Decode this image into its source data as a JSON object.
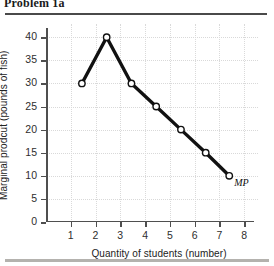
{
  "header": {
    "title": "Problem 1a"
  },
  "chart_data": {
    "type": "line",
    "title": "",
    "xlabel": "Quantity of students (number)",
    "ylabel": "Marginal prodcut (pounds of fish)",
    "xlim": [
      0,
      8.4
    ],
    "ylim": [
      0,
      42
    ],
    "grid": true,
    "legend": "none",
    "series": [
      {
        "name": "MP",
        "label": "MP",
        "x": [
          1.45,
          2.45,
          3.45,
          4.45,
          5.45,
          6.45,
          7.4
        ],
        "values": [
          30,
          40,
          30,
          25,
          20,
          15,
          10
        ],
        "marker": "open-circle",
        "color": "#111111"
      }
    ],
    "x_ticks": [
      1,
      2,
      3,
      4,
      5,
      6,
      7,
      8
    ],
    "x_tick_labels": [
      "1",
      "2",
      "3",
      "4",
      "5",
      "6",
      "7",
      "8"
    ],
    "y_ticks": [
      0,
      5,
      10,
      15,
      20,
      25,
      30,
      35,
      40
    ],
    "y_tick_labels": [
      "0",
      "5",
      "10",
      "15",
      "20",
      "25",
      "30",
      "35",
      "40"
    ],
    "annotations": [
      {
        "text": "MP",
        "x": 7.6,
        "y": 8.5
      }
    ]
  }
}
